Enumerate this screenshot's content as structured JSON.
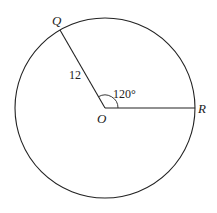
{
  "diagram": {
    "type": "circle-sector",
    "center": {
      "label": "O",
      "x": 105,
      "y": 108
    },
    "radius_px": 90,
    "points": [
      {
        "label": "Q",
        "x": 60,
        "y": 30
      },
      {
        "label": "R",
        "x": 195,
        "y": 108
      }
    ],
    "segments": [
      {
        "from": "O",
        "to": "Q",
        "label": "12"
      },
      {
        "from": "O",
        "to": "R",
        "label": ""
      }
    ],
    "angle": {
      "vertex": "O",
      "between": [
        "Q",
        "R"
      ],
      "label": "120°"
    },
    "labels": {
      "Q": "Q",
      "R": "R",
      "O": "O",
      "radius": "12",
      "angle": "120°"
    },
    "colors": {
      "stroke": "#222222",
      "background": "#ffffff"
    }
  }
}
